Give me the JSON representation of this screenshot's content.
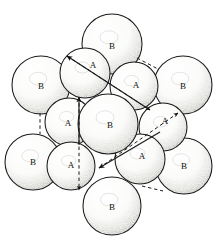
{
  "figure": {
    "colors": {
      "outline": "#1a1a1a",
      "sphere_fill": "#fbfbfa",
      "stipple": "#5a5a5a",
      "background": "#ffffff"
    }
  },
  "labels": {
    "layer_a": "A",
    "layer_b": "B"
  },
  "spheres": [
    {
      "id": "b-top",
      "label": "B",
      "layer": "B",
      "cx": 112,
      "cy": 44,
      "r": 30,
      "label_x": 112,
      "label_y": 46
    },
    {
      "id": "b-upper-left",
      "label": "B",
      "layer": "B",
      "cx": 41,
      "cy": 85,
      "r": 29,
      "label_x": 41,
      "label_y": 86
    },
    {
      "id": "b-upper-right",
      "label": "B",
      "layer": "B",
      "cx": 183,
      "cy": 85,
      "r": 29,
      "label_x": 183,
      "label_y": 86
    },
    {
      "id": "b-center",
      "label": "B",
      "layer": "B",
      "cx": 108,
      "cy": 124,
      "r": 30,
      "label_x": 110,
      "label_y": 125
    },
    {
      "id": "b-lower-left",
      "label": "B",
      "layer": "B",
      "cx": 33,
      "cy": 162,
      "r": 28,
      "label_x": 33,
      "label_y": 162
    },
    {
      "id": "b-lower-right",
      "label": "B",
      "layer": "B",
      "cx": 184,
      "cy": 166,
      "r": 28,
      "label_x": 184,
      "label_y": 166
    },
    {
      "id": "b-bottom",
      "label": "B",
      "layer": "B",
      "cx": 112,
      "cy": 206,
      "r": 29,
      "label_x": 112,
      "label_y": 207
    },
    {
      "id": "a-top-left",
      "label": "A",
      "layer": "A",
      "cx": 85,
      "cy": 73,
      "r": 25,
      "label_x": 93,
      "label_y": 65
    },
    {
      "id": "a-top-right",
      "label": "A",
      "layer": "A",
      "cx": 134,
      "cy": 86,
      "r": 24,
      "label_x": 136,
      "label_y": 85
    },
    {
      "id": "a-mid-left",
      "label": "A",
      "layer": "A",
      "cx": 69,
      "cy": 122,
      "r": 24,
      "label_x": 68,
      "label_y": 123
    },
    {
      "id": "a-mid-right",
      "label": "A",
      "layer": "A",
      "cx": 163,
      "cy": 127,
      "r": 24,
      "label_x": 165,
      "label_y": 121
    },
    {
      "id": "a-bot-left",
      "label": "A",
      "layer": "A",
      "cx": 71,
      "cy": 166,
      "r": 24,
      "label_x": 71,
      "label_y": 165
    },
    {
      "id": "a-bot-right",
      "label": "A",
      "layer": "A",
      "cx": 140,
      "cy": 159,
      "r": 25,
      "label_x": 142,
      "label_y": 156
    }
  ],
  "vectors": [
    {
      "id": "vector-diagonal-upper",
      "style": "solid",
      "x1": 150,
      "y1": 110,
      "x2": 67,
      "y2": 56,
      "arrow_at": "end"
    },
    {
      "id": "vector-vertical-upper",
      "style": "solid",
      "x1": 79,
      "y1": 145,
      "x2": 79,
      "y2": 97,
      "arrow_at": "end"
    },
    {
      "id": "vector-diagonal-lower",
      "style": "solid",
      "x1": 160,
      "y1": 132,
      "x2": 99,
      "y2": 168,
      "arrow_at": "end"
    },
    {
      "id": "vector-vertical-lower",
      "style": "dashed",
      "x1": 79,
      "y1": 97,
      "x2": 79,
      "y2": 190,
      "arrow_at": "end"
    },
    {
      "id": "vector-dashed-upper-right",
      "style": "dashed",
      "x1": 67,
      "y1": 56,
      "x2": 150,
      "y2": 110,
      "arrow_at": "end"
    },
    {
      "id": "vector-dashed-lower-right",
      "style": "dashed",
      "x1": 99,
      "y1": 168,
      "x2": 178,
      "y2": 113,
      "arrow_at": "end"
    },
    {
      "id": "connector-left-b",
      "style": "dashed",
      "x1": 40,
      "y1": 113,
      "x2": 40,
      "y2": 134,
      "arrow_at": "none"
    },
    {
      "id": "connector-top-right-b",
      "style": "dashed",
      "x1": 137,
      "y1": 58,
      "x2": 158,
      "y2": 69,
      "arrow_at": "none"
    },
    {
      "id": "connector-bottom-right-b",
      "style": "dashed",
      "x1": 142,
      "y1": 186,
      "x2": 163,
      "y2": 191,
      "arrow_at": "none"
    }
  ]
}
